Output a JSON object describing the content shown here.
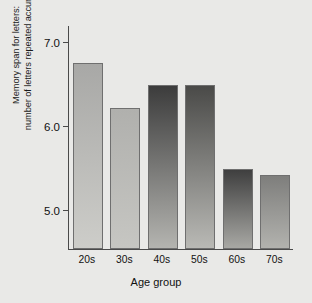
{
  "figure": {
    "background_color": "#e9e9e7",
    "axis_color": "#4a4a4a"
  },
  "axes": {
    "ylabel_line1": "Memory span for letters:",
    "ylabel_line2": "number of letters repeated accurately",
    "xlabel": "Age group",
    "yticks": [
      "7.0",
      "6.0",
      "5.0"
    ]
  },
  "chart_data": {
    "type": "bar",
    "title": "",
    "xlabel": "Age group",
    "ylabel": "Memory span for letters: number of letters repeated accurately",
    "categories": [
      "20s",
      "30s",
      "40s",
      "50s",
      "60s",
      "70s"
    ],
    "values": [
      6.77,
      6.23,
      6.5,
      6.5,
      5.5,
      5.43
    ],
    "ylim": [
      4.55,
      7.22
    ],
    "ytick_values": [
      7.0,
      6.0,
      5.0
    ],
    "ytick_labels": [
      "7.0",
      "6.0",
      "5.0"
    ],
    "xtick_labels": [
      "20s",
      "30s",
      "40s",
      "50s",
      "60s",
      "70s"
    ],
    "grid": false,
    "legend": false,
    "bar_colors_top": [
      "#a8a8a6",
      "#b0b0ad",
      "#3c3c3c",
      "#4a4a48",
      "#3f3f3f",
      "#7e7e7c"
    ],
    "bar_colors_bottom": [
      "#cdcdc9",
      "#c6c6c2",
      "#b4b4b0",
      "#b9b9b5",
      "#a8a8a4",
      "#b2b2ae"
    ]
  }
}
